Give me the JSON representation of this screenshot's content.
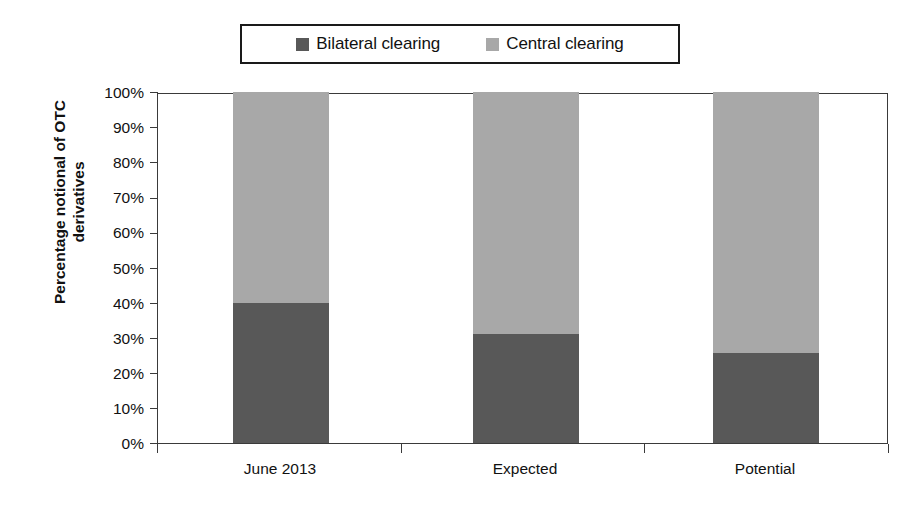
{
  "chart_data": {
    "type": "bar",
    "subtype": "stacked-100-percent",
    "title": "",
    "xlabel": "",
    "ylabel": "Percentage notional of OTC derivatives",
    "categories": [
      "June 2013",
      "Expected",
      "Potential"
    ],
    "series": [
      {
        "name": "Bilateral clearing",
        "color": "#585858",
        "values": [
          40,
          31,
          25.5
        ]
      },
      {
        "name": "Central clearing",
        "color": "#a8a8a8",
        "values": [
          60,
          69,
          74.5
        ]
      }
    ],
    "ylim": [
      0,
      100
    ],
    "ytick_values": [
      0,
      10,
      20,
      30,
      40,
      50,
      60,
      70,
      80,
      90,
      100
    ],
    "ytick_labels": [
      "0%",
      "10%",
      "20%",
      "30%",
      "40%",
      "50%",
      "60%",
      "70%",
      "80%",
      "90%",
      "100%"
    ],
    "grid": false,
    "legend_position": "top-center",
    "annotations": []
  },
  "legend": {
    "entries": [
      {
        "label": "Bilateral clearing",
        "color": "#585858"
      },
      {
        "label": "Central clearing",
        "color": "#a8a8a8"
      }
    ]
  },
  "axis": {
    "ylabel_line1": "Percentage notional of OTC",
    "ylabel_line2": "derivatives"
  }
}
